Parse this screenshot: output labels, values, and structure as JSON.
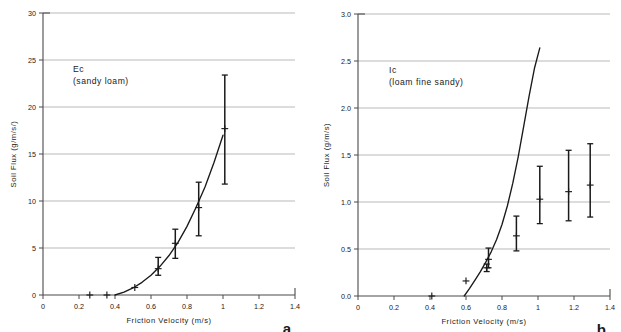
{
  "figure": {
    "background": "#ffffff",
    "ink_color": "#1a1a1a",
    "grid_color": "#b9b9b9",
    "axis_color": "#4a4a4a"
  },
  "chart_data": [
    {
      "type": "scatter",
      "panel_letter": "a",
      "title": "Ec",
      "subtitle": "(sandy loam)",
      "xlabel": "Friction Velocity  (m/s)",
      "ylabel": "Soil Flux  (g/m/s/)",
      "xlim": [
        0,
        1.4
      ],
      "ylim": [
        0,
        30
      ],
      "xticks": [
        0,
        0.2,
        0.4,
        0.6,
        0.8,
        1,
        1.2,
        1.4
      ],
      "xtick_labels": [
        "0",
        "0.2",
        "0.4",
        "0.6",
        "0.8",
        "1",
        "1.2",
        "1.4"
      ],
      "yticks": [
        0,
        5,
        10,
        15,
        20,
        25,
        30
      ],
      "ytick_labels": [
        "0",
        "5",
        "10",
        "15",
        "20",
        "25",
        "30"
      ],
      "grid": "horizontal",
      "legend": "none",
      "marker": "plus",
      "points": [
        {
          "x": 0.26,
          "y": 0.0,
          "err_low": 0.0,
          "err_high": 0.0
        },
        {
          "x": 0.355,
          "y": 0.0,
          "err_low": 0.0,
          "err_high": 0.0
        },
        {
          "x": 0.51,
          "y": 0.8,
          "err_low": 0.8,
          "err_high": 0.8
        },
        {
          "x": 0.64,
          "y": 2.8,
          "err_low": 2.1,
          "err_high": 4.0
        },
        {
          "x": 0.735,
          "y": 5.5,
          "err_low": 3.9,
          "err_high": 7.0
        },
        {
          "x": 0.865,
          "y": 9.3,
          "err_low": 6.3,
          "err_high": 12.0
        },
        {
          "x": 1.01,
          "y": 17.7,
          "err_low": 11.8,
          "err_high": 23.4
        }
      ],
      "fit_curve": {
        "label": "fitted curve",
        "x_start": 0.4,
        "x_end": 1.0,
        "points": [
          {
            "x": 0.4,
            "y": 0.0
          },
          {
            "x": 0.45,
            "y": 0.3
          },
          {
            "x": 0.5,
            "y": 0.75
          },
          {
            "x": 0.55,
            "y": 1.35
          },
          {
            "x": 0.6,
            "y": 2.1
          },
          {
            "x": 0.65,
            "y": 3.05
          },
          {
            "x": 0.7,
            "y": 4.2
          },
          {
            "x": 0.75,
            "y": 5.6
          },
          {
            "x": 0.8,
            "y": 7.3
          },
          {
            "x": 0.85,
            "y": 9.3
          },
          {
            "x": 0.9,
            "y": 11.5
          },
          {
            "x": 0.95,
            "y": 14.1
          },
          {
            "x": 1.0,
            "y": 17.0
          }
        ]
      }
    },
    {
      "type": "scatter",
      "panel_letter": "b",
      "title": "Ic",
      "subtitle": "(loam fine sandy)",
      "xlabel": "Friction Velocity  (m/s)",
      "ylabel": "Soil Flux  (g/m/s)",
      "xlim": [
        0,
        1.4
      ],
      "ylim": [
        0,
        3.0
      ],
      "xticks": [
        0,
        0.2,
        0.4,
        0.6,
        0.8,
        1,
        1.2,
        1.4
      ],
      "xtick_labels": [
        "0",
        "0.2",
        "0.4",
        "0.6",
        "0.8",
        "1",
        "1.2",
        "1.4"
      ],
      "yticks": [
        0,
        0.5,
        1.0,
        1.5,
        2.0,
        2.5,
        3.0
      ],
      "ytick_labels": [
        "0.0",
        "0.5",
        "1.0",
        "1.5",
        "2.0",
        "2.5",
        "3.0"
      ],
      "grid": "horizontal",
      "legend": "none",
      "marker": "plus",
      "points": [
        {
          "x": 0.41,
          "y": 0.0,
          "err_low": 0.0,
          "err_high": 0.0
        },
        {
          "x": 0.6,
          "y": 0.16,
          "err_low": 0.16,
          "err_high": 0.16
        },
        {
          "x": 0.715,
          "y": 0.3,
          "err_low": 0.26,
          "err_high": 0.34
        },
        {
          "x": 0.725,
          "y": 0.39,
          "err_low": 0.3,
          "err_high": 0.51
        },
        {
          "x": 0.88,
          "y": 0.64,
          "err_low": 0.48,
          "err_high": 0.85
        },
        {
          "x": 1.01,
          "y": 1.03,
          "err_low": 0.77,
          "err_high": 1.38
        },
        {
          "x": 1.17,
          "y": 1.11,
          "err_low": 0.8,
          "err_high": 1.55
        },
        {
          "x": 1.29,
          "y": 1.18,
          "err_low": 0.84,
          "err_high": 1.62
        }
      ],
      "fit_curve": {
        "label": "fitted curve",
        "x_start": 0.59,
        "x_end": 1.01,
        "points": [
          {
            "x": 0.59,
            "y": 0.0
          },
          {
            "x": 0.62,
            "y": 0.08
          },
          {
            "x": 0.65,
            "y": 0.17
          },
          {
            "x": 0.68,
            "y": 0.26
          },
          {
            "x": 0.71,
            "y": 0.36
          },
          {
            "x": 0.74,
            "y": 0.47
          },
          {
            "x": 0.77,
            "y": 0.6
          },
          {
            "x": 0.8,
            "y": 0.76
          },
          {
            "x": 0.83,
            "y": 0.96
          },
          {
            "x": 0.86,
            "y": 1.2
          },
          {
            "x": 0.89,
            "y": 1.48
          },
          {
            "x": 0.92,
            "y": 1.8
          },
          {
            "x": 0.95,
            "y": 2.12
          },
          {
            "x": 0.98,
            "y": 2.42
          },
          {
            "x": 1.01,
            "y": 2.64
          }
        ]
      }
    }
  ]
}
